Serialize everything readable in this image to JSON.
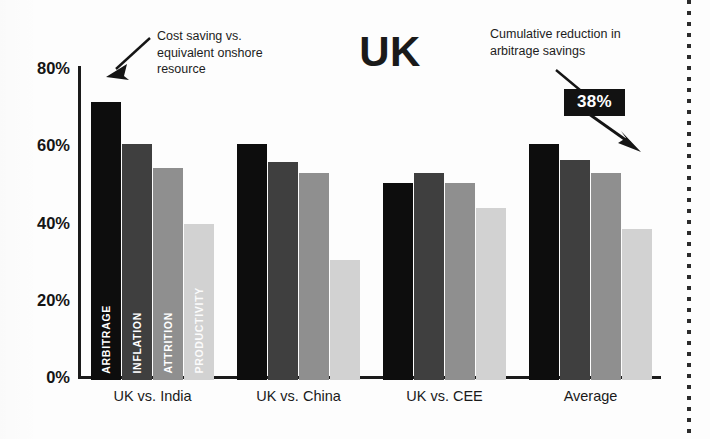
{
  "title": "UK",
  "annotations": {
    "left": "Cost saving vs. equivalent onshore resource",
    "right": "Cumulative reduction in arbitrage savings",
    "badge": "38%"
  },
  "icons": {
    "arrow_left": "arrow-down-left-icon",
    "arrow_badge_in": "arrow-down-right-icon",
    "arrow_badge_out": "arrow-down-right-icon"
  },
  "chart_data": {
    "type": "bar",
    "title": "UK",
    "xlabel": "",
    "ylabel": "",
    "ylim": [
      0,
      80
    ],
    "grid": false,
    "legend_position": "in-bars",
    "ytick_labels": [
      "80%",
      "60%",
      "40%",
      "20%",
      "0%"
    ],
    "ytick_values": [
      80,
      60,
      40,
      20,
      0
    ],
    "categories": [
      "UK vs. India",
      "UK vs. China",
      "UK vs. CEE",
      "Average"
    ],
    "series": [
      {
        "name": "ARBITRAGE",
        "color": "#0d0d0d",
        "values": [
          72,
          61,
          51,
          61
        ]
      },
      {
        "name": "INFLATION",
        "color": "#3f3f3f",
        "values": [
          61,
          56.5,
          53.5,
          57
        ]
      },
      {
        "name": "ATTRITION",
        "color": "#8f8f8f",
        "values": [
          55,
          53.5,
          51,
          53.5
        ]
      },
      {
        "name": "PRODUCTIVITY",
        "color": "#d2d2d2",
        "values": [
          40.5,
          31,
          44.5,
          39
        ]
      }
    ],
    "annotations": [
      {
        "text": "Cost saving vs. equivalent onshore resource",
        "points_to": "UK vs. India / ARBITRAGE"
      },
      {
        "text": "Cumulative reduction in arbitrage savings",
        "points_to": "Average / PRODUCTIVITY",
        "value": "38%"
      }
    ]
  }
}
